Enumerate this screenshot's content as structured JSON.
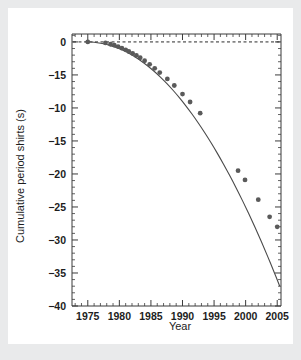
{
  "figure": {
    "background_color": "#ffffff",
    "page_background_color": "#e9eaeb",
    "axis_color": "#3b3b3b",
    "marker_color": "#5a5a5a",
    "curve_color": "#4a4a4a"
  },
  "chart_data": {
    "type": "scatter",
    "title": "",
    "subtitle": "",
    "xlabel": "Year",
    "ylabel": "Cumulative period shirts (s)",
    "xlim": [
      1972.5,
      2005.6
    ],
    "ylim": [
      -40,
      1.2
    ],
    "grid": false,
    "legend": null,
    "x_ticks_major": [
      1975,
      1980,
      1985,
      1990,
      1995,
      2000,
      2005
    ],
    "x_tick_labels": [
      "1975",
      "1980",
      "1985",
      "1990",
      "1995",
      "2000",
      "2005"
    ],
    "x_tick_minor_step": 1,
    "y_ticks_major": [
      0,
      -5,
      -10,
      -15,
      -20,
      -25,
      -30,
      -35,
      -40
    ],
    "y_tick_labels": [
      "0",
      "-15",
      "-10",
      "-15",
      "-20",
      "-25",
      "-30",
      "-35",
      "-40"
    ],
    "y_tick_minor_step": 1,
    "annotations": [
      {
        "name": "zero-reference-line",
        "type": "hline",
        "y": 0,
        "style": "dashed"
      }
    ],
    "series": [
      {
        "name": "Cumulative period shift",
        "marker": "circle",
        "line": "solid",
        "x": [
          1975.0,
          1977.8,
          1978.6,
          1979.2,
          1979.8,
          1980.4,
          1981.0,
          1981.5,
          1982.1,
          1982.7,
          1983.3,
          1984.0,
          1984.8,
          1985.6,
          1986.4,
          1987.6,
          1988.7,
          1990.0,
          1991.2,
          1992.8,
          1998.8,
          1999.9,
          2002.0,
          2003.8,
          2005.0
        ],
        "y": [
          0.0,
          -0.15,
          -0.35,
          -0.5,
          -0.7,
          -0.95,
          -1.2,
          -1.45,
          -1.75,
          -2.05,
          -2.4,
          -2.85,
          -3.4,
          -4.0,
          -4.65,
          -5.6,
          -6.6,
          -7.9,
          -9.1,
          -10.8,
          -19.5,
          -20.9,
          -23.9,
          -26.5,
          -28.0
        ],
        "x_fit": [
          1974.6,
          1975.5,
          1976.5,
          1977.5,
          1978.5,
          1979.5,
          1980.5,
          1981.5,
          1982.5,
          1983.5,
          1984.5,
          1985.5,
          1986.5,
          1987.5,
          1988.5,
          1989.5,
          1990.5,
          1991.5,
          1992.5,
          1993.5,
          1994.5,
          1995.5,
          1996.5,
          1997.5,
          1998.5,
          1999.5,
          2000.5,
          2001.5,
          2002.5,
          2003.5,
          2004.5,
          2005.4
        ],
        "y_fit": [
          0.02,
          -0.02,
          -0.12,
          -0.28,
          -0.52,
          -0.84,
          -1.24,
          -1.72,
          -2.28,
          -2.92,
          -3.64,
          -4.44,
          -5.32,
          -6.28,
          -7.32,
          -8.44,
          -9.64,
          -10.92,
          -12.28,
          -13.72,
          -15.24,
          -16.84,
          -18.52,
          -20.28,
          -22.12,
          -24.04,
          -26.04,
          -28.12,
          -30.28,
          -32.52,
          -34.84,
          -37.0
        ]
      }
    ]
  }
}
